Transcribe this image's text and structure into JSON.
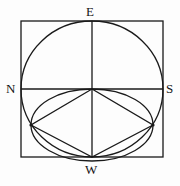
{
  "figure": {
    "name": "compass-rose-geometric-construction",
    "background_color": "#fdfdfd",
    "stroke_color": "#1a1a1a",
    "labels": {
      "top": "E",
      "left": "N",
      "right": "S",
      "bottom": "W"
    },
    "geometry": {
      "square": {
        "left": 21,
        "top": 21,
        "right": 163,
        "bottom": 157
      },
      "center": {
        "x": 92,
        "y": 89
      },
      "circle": {
        "cx": 92,
        "cy": 89,
        "rx": 71,
        "ry": 68
      },
      "node_left": {
        "x": 31,
        "y": 125
      },
      "node_right": {
        "x": 153,
        "y": 125
      },
      "vertical_axis": {
        "x": 92,
        "y1": 21,
        "y2": 157
      },
      "horizontal_axis": {
        "y": 89,
        "x1": 21,
        "x2": 163
      },
      "lens_ellipse": {
        "cx": 92,
        "cy": 125,
        "rx": 61,
        "ry": 36
      },
      "rhombus_points": "92,89 31,125 92,157 153,125"
    }
  }
}
